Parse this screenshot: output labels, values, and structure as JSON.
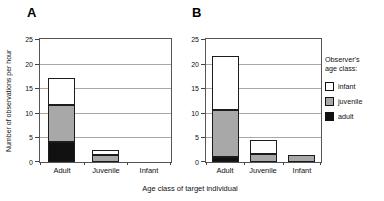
{
  "figure": {
    "panels": [
      {
        "label": "A"
      },
      {
        "label": "B"
      }
    ],
    "y_axis_title": "Number of observations per hour",
    "x_axis_title": "Age class of target individual",
    "legend": {
      "title_line1": "Observer's",
      "title_line2": "age class:",
      "items": [
        {
          "label": "infant",
          "color": "#ffffff"
        },
        {
          "label": "juvenile",
          "color": "#a8a8a8"
        },
        {
          "label": "adult",
          "color": "#111111"
        }
      ]
    }
  },
  "chart_data": [
    {
      "type": "bar",
      "stacked": true,
      "stack_order": "bottom-to-top",
      "panel_label": "A",
      "categories": [
        "Adult",
        "Juvenile",
        "Infant"
      ],
      "xlabel": "Age class of target individual",
      "ylabel": "Number of observations per hour",
      "ylim": [
        0,
        25
      ],
      "yticks": [
        0,
        5,
        10,
        15,
        20,
        25
      ],
      "grid": true,
      "series": [
        {
          "name": "adult",
          "color": "#111111",
          "values": [
            4,
            0,
            0
          ]
        },
        {
          "name": "juvenile",
          "color": "#a8a8a8",
          "values": [
            7.5,
            1.5,
            0
          ]
        },
        {
          "name": "infant",
          "color": "#ffffff",
          "values": [
            5.5,
            1,
            0
          ]
        }
      ],
      "totals": [
        17,
        2.5,
        0
      ]
    },
    {
      "type": "bar",
      "stacked": true,
      "stack_order": "bottom-to-top",
      "panel_label": "B",
      "categories": [
        "Adult",
        "Juvenile",
        "Infant"
      ],
      "xlabel": "Age class of target individual",
      "ylabel": "Number of observations per hour",
      "ylim": [
        0,
        25
      ],
      "yticks": [
        0,
        5,
        10,
        15,
        20,
        25
      ],
      "grid": true,
      "legend_position": "right",
      "series": [
        {
          "name": "adult",
          "color": "#111111",
          "values": [
            1,
            0,
            0
          ]
        },
        {
          "name": "juvenile",
          "color": "#a8a8a8",
          "values": [
            9.5,
            1.7,
            1.5
          ]
        },
        {
          "name": "infant",
          "color": "#ffffff",
          "values": [
            11,
            2.8,
            0
          ]
        }
      ],
      "totals": [
        21.5,
        4.5,
        1.5
      ]
    }
  ]
}
